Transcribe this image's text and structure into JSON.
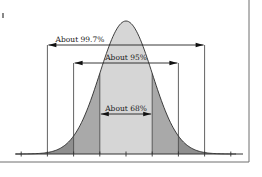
{
  "diagram": {
    "type": "normal-distribution-empirical-rule",
    "mean": 0,
    "sigma": 1,
    "axis_ticks_sigma": [
      -4,
      -3,
      -2,
      -1,
      0,
      1,
      2,
      3,
      4
    ],
    "intervals": [
      {
        "label": "About 99.7%",
        "from_sigma": -3,
        "to_sigma": 3
      },
      {
        "label": "About 95%",
        "from_sigma": -2,
        "to_sigma": 2
      },
      {
        "label": "About 68%",
        "from_sigma": -1,
        "to_sigma": 1
      }
    ],
    "colors": {
      "center_fill": "#d6d6d6",
      "middle_fill": "#a9a9a9",
      "tail_fill": "#8f8f8f",
      "line": "#3a3a3a",
      "frame": "#6e6e6e"
    }
  }
}
